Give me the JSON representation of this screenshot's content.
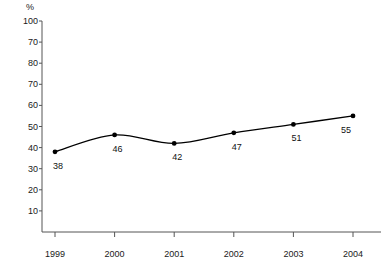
{
  "chart_data": {
    "type": "line",
    "title": "",
    "subtitle": "",
    "xlabel": "",
    "ylabel": "%",
    "unit_label": "%",
    "categories": [
      "1999",
      "2000",
      "2001",
      "2002",
      "2003",
      "2004"
    ],
    "x": [
      1999,
      2000,
      2001,
      2002,
      2003,
      2004
    ],
    "values": [
      38,
      46,
      42,
      47,
      51,
      55
    ],
    "series": [
      {
        "name": "",
        "values": [
          38,
          46,
          42,
          47,
          51,
          55
        ]
      }
    ],
    "point_labels": [
      "38",
      "46",
      "42",
      "47",
      "51",
      "55"
    ],
    "ylim": [
      0,
      100
    ],
    "ytick_values": [
      100,
      90,
      80,
      70,
      60,
      50,
      40,
      30,
      20,
      10
    ],
    "ytick_labels": [
      "100",
      "70",
      "80",
      "70",
      "60",
      "50",
      "40",
      "30",
      "20",
      "10"
    ],
    "grid": false,
    "legend": "none",
    "line_color": "#000000",
    "marker_color": "#000000",
    "axis_color": "#555555",
    "text_color": "#1a1a1a",
    "background_color": "#ffffff",
    "marker_style": "filled-circle",
    "line_style": "smooth"
  }
}
